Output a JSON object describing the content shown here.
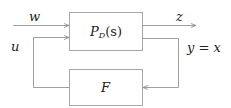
{
  "diagram": {
    "type": "block-diagram",
    "colors": {
      "line": "#9a9a9a",
      "text": "#222222",
      "background": "#ffffff"
    },
    "blocks": [
      {
        "id": "plant",
        "label_main": "P",
        "label_sub": "D",
        "label_arg": "(s)"
      },
      {
        "id": "controller",
        "label": "F"
      }
    ],
    "signals": {
      "w": "w",
      "u": "u",
      "z": "z",
      "y": "y = x"
    }
  }
}
